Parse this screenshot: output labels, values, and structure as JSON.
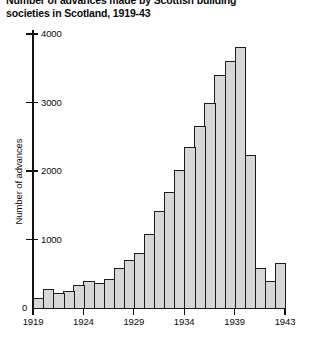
{
  "chart_data": {
    "type": "bar",
    "title": "Number of advances made by Scottish building\nsocieties in Scotland, 1919-43",
    "xlabel": "",
    "ylabel": "Number of advances",
    "ylim": [
      0,
      4200
    ],
    "yticks": [
      0,
      1000,
      2000,
      3000,
      4000
    ],
    "ytick_labels": [
      "0",
      "1000",
      "2000",
      "3000",
      "4000"
    ],
    "xticks": [
      1919,
      1924,
      1929,
      1934,
      1939,
      1943
    ],
    "xtick_labels": [
      "1919",
      "1924",
      "1929",
      "1934",
      "1939",
      "1943"
    ],
    "grid": false,
    "legend": "none",
    "bar_style": "contiguous-histogram",
    "bar_fill": "#d7d7d7",
    "bar_edge": "#1d1d1d",
    "categories": [
      "1919",
      "1920",
      "1921",
      "1922",
      "1923",
      "1924",
      "1925",
      "1926",
      "1927",
      "1928",
      "1929",
      "1930",
      "1931",
      "1932",
      "1933",
      "1934",
      "1935",
      "1936",
      "1937",
      "1938",
      "1939",
      "1940",
      "1941",
      "1942",
      "1943"
    ],
    "values": [
      150,
      280,
      220,
      250,
      330,
      400,
      360,
      420,
      580,
      700,
      810,
      1080,
      1420,
      1700,
      2020,
      2350,
      2650,
      3000,
      3400,
      3600,
      3810,
      2230,
      580,
      390,
      660
    ]
  }
}
